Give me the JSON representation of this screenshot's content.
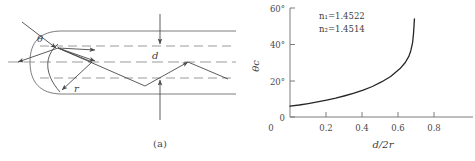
{
  "figure": {
    "panels": [
      {
        "id": "a",
        "caption": "(a)",
        "labels": {
          "theta": "θ",
          "d": "d",
          "r": "r"
        },
        "description": "ray-tracing-in-graded-index-fiber-end"
      },
      {
        "id": "b",
        "caption": "(b)",
        "annotations": {
          "n1": "n₁=1.4522",
          "n2": "n₂=1.4514"
        }
      }
    ]
  },
  "chart_data": {
    "type": "line",
    "title": "",
    "xlabel": "d/2r",
    "ylabel": "θc",
    "xlim": [
      0,
      1.0
    ],
    "ylim": [
      0,
      60
    ],
    "xticks": [
      0,
      0.2,
      0.4,
      0.6,
      0.8
    ],
    "xticklabels": [
      "0",
      "0.2",
      "0.4",
      "0.6",
      "0.8"
    ],
    "yticks": [
      0,
      20,
      40,
      60
    ],
    "yticklabels": [
      "0",
      "20°",
      "40°",
      "60°"
    ],
    "grid": false,
    "legend": false,
    "annotations": [
      "n₁=1.4522",
      "n₂=1.4514"
    ],
    "series": [
      {
        "name": "critical-angle",
        "color": "#262626",
        "x": [
          0.0,
          0.05,
          0.1,
          0.15,
          0.2,
          0.25,
          0.3,
          0.35,
          0.4,
          0.45,
          0.5,
          0.55,
          0.6,
          0.63,
          0.65,
          0.66,
          0.67,
          0.675,
          0.68
        ],
        "y": [
          6.0,
          6.6,
          7.4,
          8.3,
          9.3,
          10.4,
          11.7,
          13.1,
          14.8,
          16.8,
          19.3,
          22.3,
          26.5,
          30.0,
          33.5,
          36.5,
          41.0,
          46.0,
          54.0
        ]
      }
    ]
  }
}
